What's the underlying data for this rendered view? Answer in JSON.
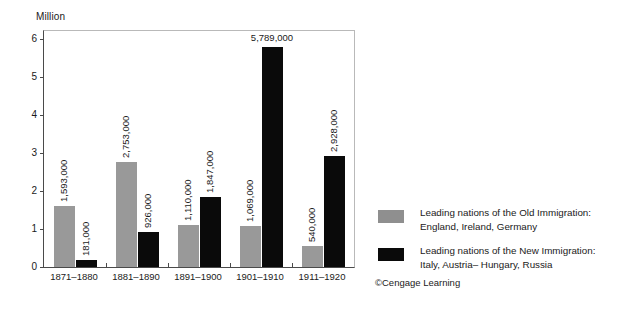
{
  "chart_data": {
    "type": "bar",
    "title": "",
    "unit_label": "Million",
    "xlabel": "",
    "ylabel": "Million",
    "ylim": [
      0,
      6.2
    ],
    "yticks": [
      0,
      1,
      2,
      3,
      4,
      5,
      6
    ],
    "ytick_labels": [
      "0",
      "1",
      "2",
      "3",
      "4",
      "5",
      "6"
    ],
    "grid": false,
    "legend_position": "right",
    "categories": [
      "1871–1880",
      "1881–1890",
      "1891–1900",
      "1901–1910",
      "1911–1920"
    ],
    "series": [
      {
        "name": "Leading nations of the Old Immigration: England, Ireland, Germany",
        "short_name": "Old Immigration",
        "color": "#999999",
        "values": [
          1593000,
          2753000,
          1110000,
          1069000,
          540000
        ],
        "value_labels": [
          "1,593,000",
          "2,753,000",
          "1,110,000",
          "1,069,000",
          "540,000"
        ],
        "values_million": [
          1.593,
          2.753,
          1.11,
          1.069,
          0.54
        ]
      },
      {
        "name": "Leading nations of the New Immigration: Italy, Austria– Hungary, Russia",
        "short_name": "New Immigration",
        "color": "#0a0a0a",
        "values": [
          181000,
          926000,
          1847000,
          5789000,
          2928000
        ],
        "value_labels": [
          "181,000",
          "926,000",
          "1,847,000",
          "5,789,000",
          "2,928,000"
        ],
        "values_million": [
          0.181,
          0.926,
          1.847,
          5.789,
          2.928
        ]
      }
    ]
  },
  "legend": {
    "entries": [
      {
        "swatch": "old",
        "line1": "Leading nations of the Old Immigration:",
        "line2": "England, Ireland, Germany"
      },
      {
        "swatch": "new",
        "line1": "Leading nations of the New Immigration:",
        "line2": "Italy, Austria– Hungary, Russia"
      }
    ]
  },
  "credit": "©Cengage Learning"
}
